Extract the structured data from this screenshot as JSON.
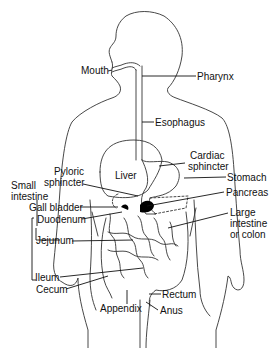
{
  "diagram": {
    "labels": {
      "mouth": "Mouth",
      "pharynx": "Pharynx",
      "esophagus": "Esophagus",
      "cardiac_sphincter_1": "Cardiac",
      "cardiac_sphincter_2": "sphincter",
      "liver": "Liver",
      "pyloric_sphincter_1": "Pyloric",
      "pyloric_sphincter_2": "sphincter",
      "stomach": "Stomach",
      "small_intestine_1": "Small",
      "small_intestine_2": "intestine",
      "pancreas": "Pancreas",
      "gall_bladder": "Gall bladder",
      "duodenum": "Duodenum",
      "large_intestine_1": "Large",
      "large_intestine_2": "intestine",
      "large_intestine_3": "or colon",
      "jejunum": "Jejunum",
      "ileum": "Ileum",
      "cecum": "Cecum",
      "appendix": "Appendix",
      "rectum": "Rectum",
      "anus": "Anus"
    },
    "colors": {
      "line": "#222222",
      "fill": "#000000",
      "background": "#ffffff"
    }
  }
}
